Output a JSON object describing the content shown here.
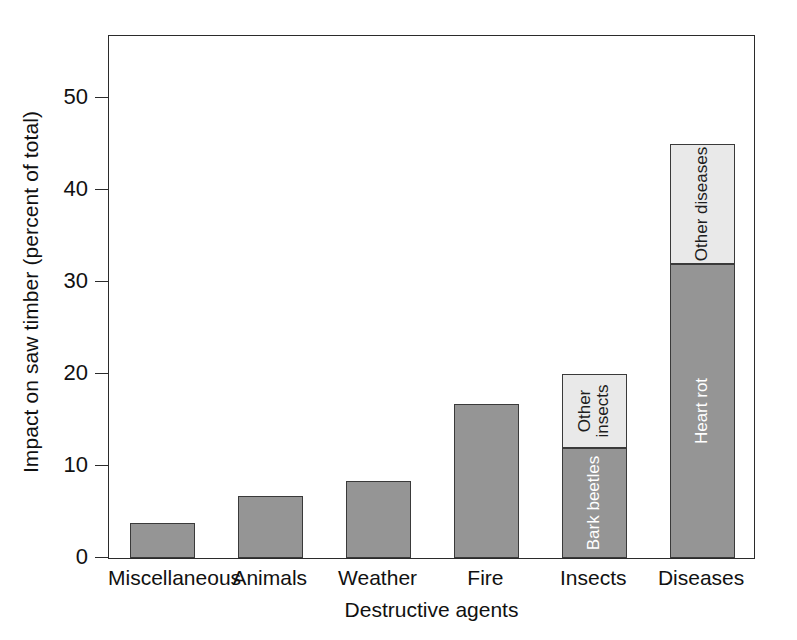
{
  "chart_data": {
    "type": "bar",
    "stacked": true,
    "title": "",
    "xlabel": "Destructive agents",
    "ylabel": "Impact on saw timber (percent of total)",
    "categories": [
      "Miscellaneous",
      "Animals",
      "Weather",
      "Fire",
      "Insects",
      "Diseases"
    ],
    "ylim": [
      0,
      57
    ],
    "yticks": [
      0,
      10,
      20,
      30,
      40,
      50
    ],
    "ytick_labels": [
      "0",
      "10",
      "20",
      "30",
      "40",
      "50"
    ],
    "grid": false,
    "legend": "none (segments labelled in place)",
    "values": [
      3.8,
      6.8,
      8.4,
      16.7,
      20.0,
      45.0
    ],
    "bars": [
      {
        "category": "Miscellaneous",
        "total": 3.8,
        "segments": [
          {
            "label": "",
            "value": 3.8,
            "shade": "dark"
          }
        ]
      },
      {
        "category": "Animals",
        "total": 6.8,
        "segments": [
          {
            "label": "",
            "value": 6.8,
            "shade": "dark"
          }
        ]
      },
      {
        "category": "Weather",
        "total": 8.4,
        "segments": [
          {
            "label": "",
            "value": 8.4,
            "shade": "dark"
          }
        ]
      },
      {
        "category": "Fire",
        "total": 16.7,
        "segments": [
          {
            "label": "",
            "value": 16.7,
            "shade": "dark"
          }
        ]
      },
      {
        "category": "Insects",
        "total": 20.0,
        "segments": [
          {
            "label": "Bark beetles",
            "value": 12.0,
            "shade": "dark"
          },
          {
            "label": "Other insects",
            "value": 8.0,
            "shade": "light"
          }
        ]
      },
      {
        "category": "Diseases",
        "total": 45.0,
        "segments": [
          {
            "label": "Heart rot",
            "value": 32.0,
            "shade": "dark"
          },
          {
            "label": "Other diseases",
            "value": 13.0,
            "shade": "light"
          }
        ]
      }
    ],
    "colors": {
      "dark_segment": "#959595",
      "light_segment": "#e9e9e9",
      "axis": "#2b2b2b",
      "bar_outline": "#3a3a3a",
      "background": "#ffffff",
      "text": "#111111"
    }
  }
}
